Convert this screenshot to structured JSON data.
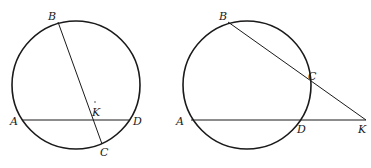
{
  "figures": [
    {
      "name": "chords-intersecting-inside",
      "labels": {
        "A": "A",
        "B": "B",
        "C": "C",
        "D": "D",
        "K": "K"
      }
    },
    {
      "name": "secants-intersecting-outside",
      "labels": {
        "A": "A",
        "B": "B",
        "C": "C",
        "D": "D",
        "K": "K"
      }
    }
  ],
  "colors": {
    "stroke": "#1a1a1a",
    "background": "#ffffff"
  }
}
